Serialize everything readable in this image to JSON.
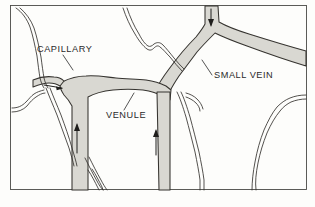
{
  "figure": {
    "background_color": "#fdfdfb",
    "frame_color": "#4a4a46",
    "vessel_fill_color": "#d9d8d2",
    "vessel_outline_color": "#35332f",
    "label_color": "#2a2a2a"
  },
  "labels": [
    {
      "id": "capillary",
      "text": "CAPILLARY",
      "x": 37,
      "y": 52,
      "leader": "M 63 55 L 73 70"
    },
    {
      "id": "venule",
      "text": "VENULE",
      "x": 106,
      "y": 118,
      "leader": "M 124 110 L 134 93"
    },
    {
      "id": "small_vein",
      "text": "SMALL VEIN",
      "x": 214,
      "y": 78,
      "leader": "M 212 75 L 202 60"
    }
  ],
  "arrows": [
    {
      "id": "capillary-flow-arrow",
      "direction": "right",
      "description": "blood flow in capillary toward venule",
      "x": 51,
      "y": 86
    },
    {
      "id": "venule-flow-arrow-left",
      "direction": "up",
      "description": "blood flow up the venule",
      "x": 77,
      "y": 128
    },
    {
      "id": "venule-flow-arrow-right",
      "direction": "up",
      "description": "blood flow up the lower venule branch",
      "x": 156,
      "y": 132
    },
    {
      "id": "small-vein-flow-arrow",
      "direction": "down",
      "description": "blood flow down into the small vein",
      "x": 211,
      "y": 12
    }
  ],
  "vessels": [
    {
      "id": "small-vein",
      "name": "small vein",
      "type": "shaded",
      "flow": "down-right"
    },
    {
      "id": "venule",
      "name": "venule",
      "type": "shaded",
      "flow": "up"
    },
    {
      "id": "capillary-shaded",
      "name": "capillary",
      "type": "shaded",
      "flow": "right"
    },
    {
      "id": "capillary-thin-upper-left",
      "name": "thin capillary (upper left)",
      "type": "outline",
      "flow": "down"
    },
    {
      "id": "capillary-thin-upper-mid",
      "name": "thin capillary (upper middle)",
      "type": "outline",
      "flow": "down-right"
    },
    {
      "id": "capillary-thin-lower-left",
      "name": "thin capillary (lower left)",
      "type": "outline",
      "flow": "down"
    },
    {
      "id": "capillary-thin-lower-mid",
      "name": "thin capillary (lower middle)",
      "type": "outline",
      "flow": "down"
    },
    {
      "id": "capillary-thin-right",
      "name": "thin capillary (right)",
      "type": "outline",
      "flow": "down"
    },
    {
      "id": "capillary-thin-far-right",
      "name": "thin capillary (far right)",
      "type": "outline",
      "flow": "down"
    }
  ]
}
